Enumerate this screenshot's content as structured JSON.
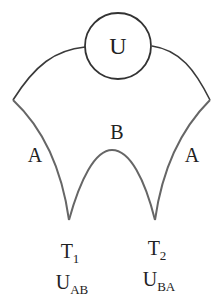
{
  "diagram": {
    "type": "thermocouple-circuit",
    "meter": {
      "label": "U"
    },
    "conductors": [
      {
        "name": "A",
        "side": "left"
      },
      {
        "name": "B",
        "side": "middle"
      },
      {
        "name": "A",
        "side": "right"
      }
    ],
    "junctions": [
      {
        "name": "T",
        "index": "1",
        "voltage_main": "U",
        "voltage_sub": "AB"
      },
      {
        "name": "T",
        "index": "2",
        "voltage_main": "U",
        "voltage_sub": "BA"
      }
    ]
  },
  "colors": {
    "stroke": "#555555",
    "wire_dark": "#333333",
    "text": "#222222"
  }
}
